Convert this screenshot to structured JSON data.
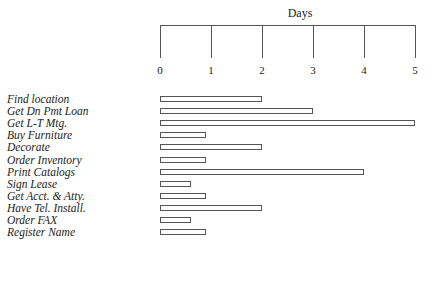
{
  "chart_data": {
    "type": "bar",
    "orientation": "horizontal",
    "title": "",
    "xlabel": "Days",
    "ylabel": "",
    "xlim": [
      0,
      5
    ],
    "x_ticks": [
      "0",
      "1",
      "2",
      "3",
      "4",
      "5"
    ],
    "axis_position": "top",
    "grid": false,
    "legend": null,
    "categories": [
      "Find location",
      "Get Dn Pmt Loan",
      "Get L-T Mtg.",
      "Buy Furniture",
      "Decorate",
      "Order Inventory",
      "Print Catalogs",
      "Sign Lease",
      "Get Acct. & Atty.",
      "Have Tel. Install.",
      "Order FAX",
      "Register Name"
    ],
    "values": [
      2,
      3,
      5,
      0.9,
      2,
      0.9,
      4,
      0.6,
      0.9,
      2,
      0.6,
      0.9
    ]
  }
}
